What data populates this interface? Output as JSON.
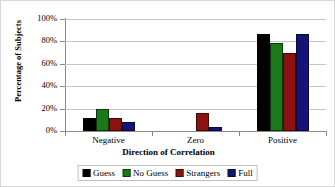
{
  "chart_data": {
    "type": "bar",
    "title": "",
    "xlabel": "Direction of Correlation",
    "ylabel": "Percentage of Subjects",
    "categories": [
      "Negative",
      "Zero",
      "Positive"
    ],
    "series": [
      {
        "name": "Guess",
        "color": "#000000",
        "values": [
          12,
          0,
          87
        ]
      },
      {
        "name": "No Guess",
        "color": "#1a7a1a",
        "values": [
          20,
          0,
          79
        ]
      },
      {
        "name": "Strangers",
        "color": "#8e1111",
        "values": [
          12,
          16,
          70
        ]
      },
      {
        "name": "Full",
        "color": "#141478",
        "values": [
          8,
          4,
          87
        ]
      }
    ],
    "ylim": [
      0,
      100
    ],
    "yticks": [
      0,
      20,
      40,
      60,
      80,
      100
    ],
    "ytick_labels": [
      "0%",
      "20%",
      "40%",
      "60%",
      "80%",
      "100%"
    ],
    "grid": true,
    "legend_position": "bottom"
  }
}
